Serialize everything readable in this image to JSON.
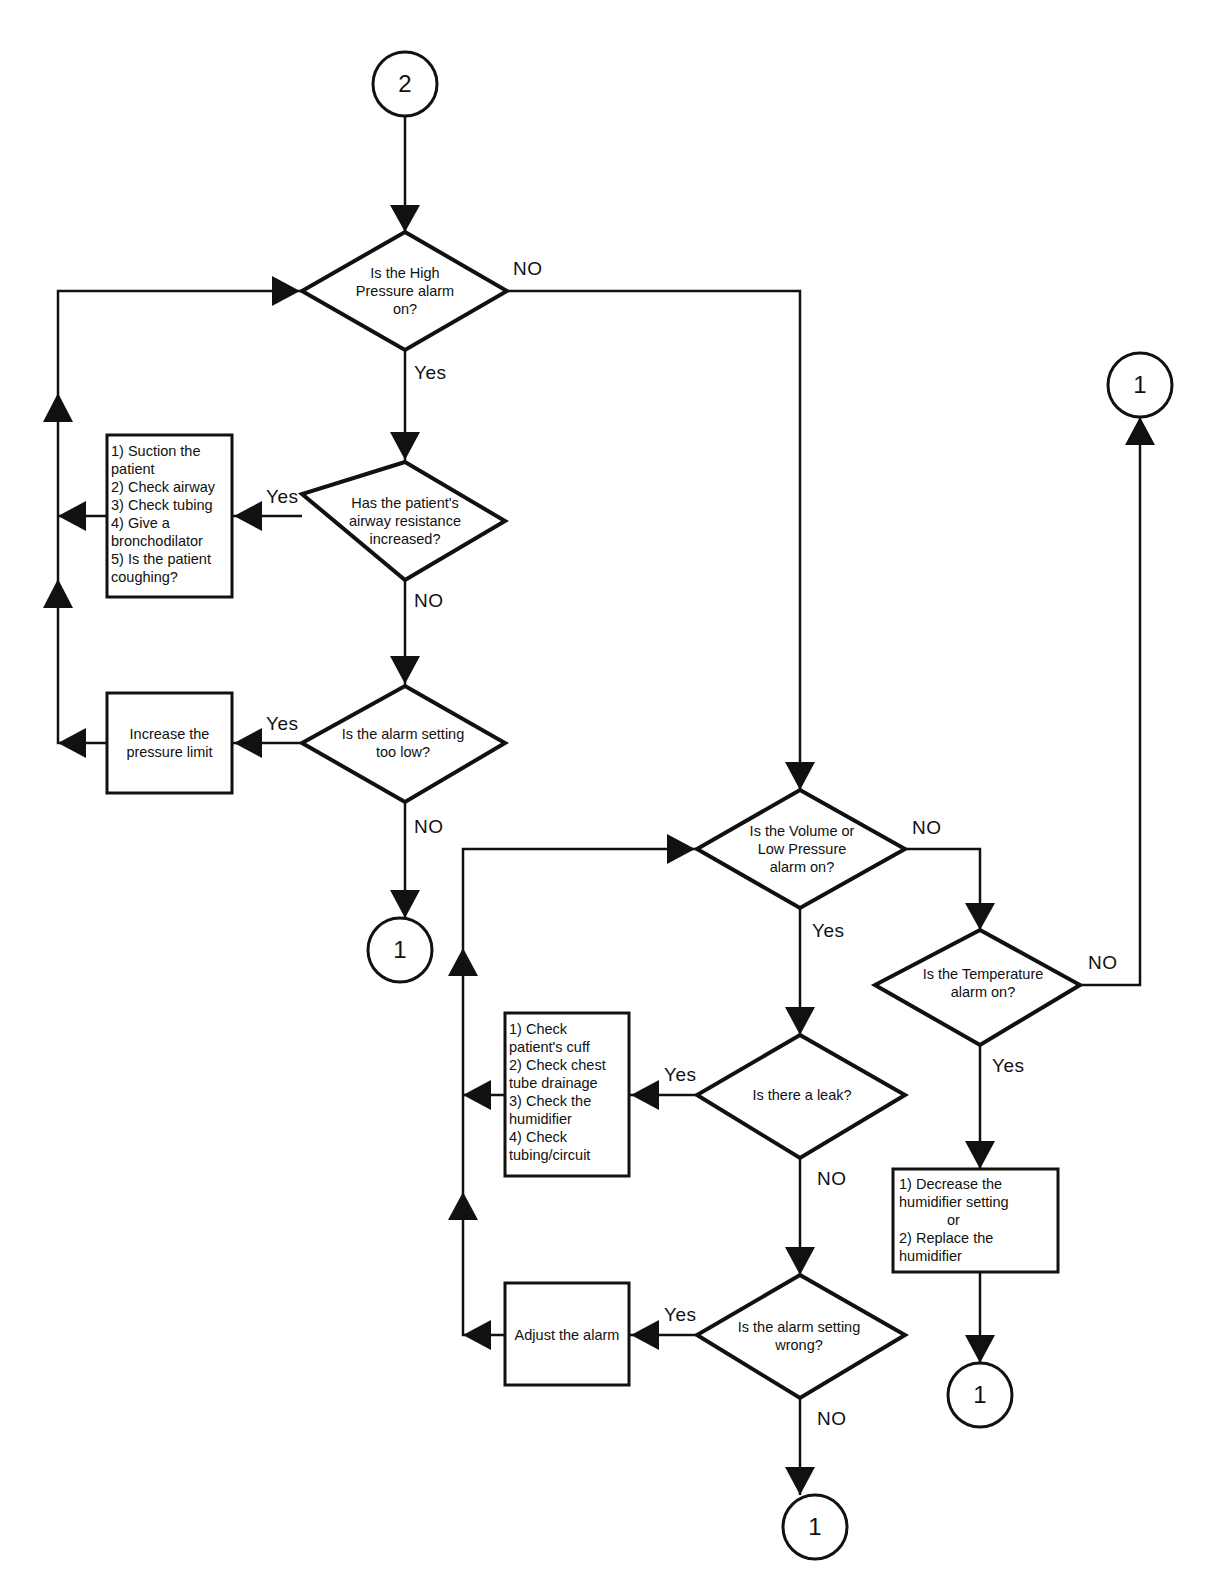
{
  "connectors": {
    "start": "2",
    "end_a": "1",
    "end_b": "1",
    "end_c": "1",
    "end_d": "1"
  },
  "decisions": {
    "high_pressure": "Is the High Pressure alarm on?",
    "airway_resistance": "Has the patient's airway resistance increased?",
    "alarm_too_low": "Is the alarm setting too low?",
    "volume_low_pressure": "Is the Volume or Low Pressure alarm on?",
    "temperature": "Is the Temperature alarm on?",
    "leak": "Is there a leak?",
    "alarm_wrong": "Is the alarm setting wrong?"
  },
  "decision_lines": {
    "high_pressure": [
      "Is the High",
      "Pressure alarm",
      "on?"
    ],
    "airway_resistance": [
      "Has the patient's",
      "airway resistance",
      "increased?"
    ],
    "alarm_too_low": [
      "Is the alarm setting",
      "too low?"
    ],
    "volume_low_pressure": [
      "Is the Volume or",
      "Low Pressure",
      "alarm on?"
    ],
    "temperature": [
      "Is the Temperature",
      "alarm on?"
    ],
    "leak": [
      "Is there a leak?"
    ],
    "alarm_wrong": [
      "Is the alarm setting",
      "wrong?"
    ]
  },
  "actions": {
    "airway_steps": [
      "1) Suction the",
      "patient",
      "2) Check airway",
      "3) Check tubing",
      "4) Give a",
      "bronchodilator",
      "5) Is the patient",
      "coughing?"
    ],
    "increase_limit": [
      "Increase the",
      "pressure limit"
    ],
    "leak_steps": [
      "1) Check",
      "patient's cuff",
      "2) Check chest",
      "tube drainage",
      "3) Check the",
      "humidifier",
      "4) Check",
      "tubing/circuit"
    ],
    "humidifier_steps": [
      "1) Decrease the",
      "humidifier setting",
      "or",
      "2) Replace the",
      "humidifier"
    ],
    "adjust_alarm": [
      "Adjust the alarm"
    ]
  },
  "labels": {
    "yes": "Yes",
    "no": "NO"
  },
  "colors": {
    "ink": "#111111",
    "background": "#ffffff"
  }
}
